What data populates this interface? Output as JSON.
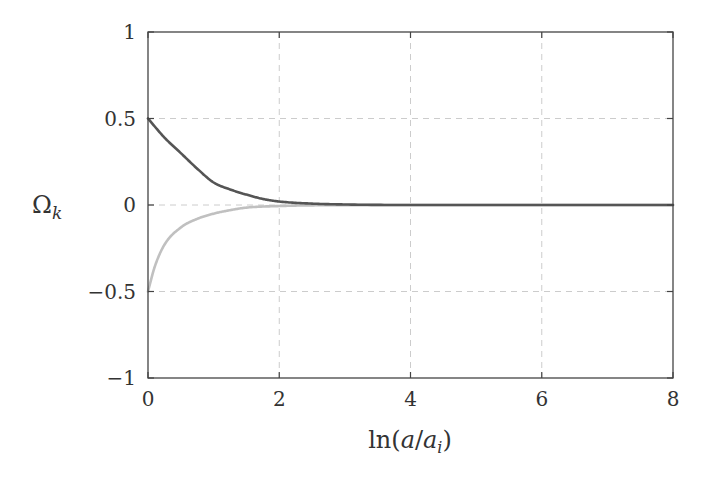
{
  "chart_data": {
    "type": "line",
    "title": "",
    "xlabel": "ln(a/a_i)",
    "ylabel": "Ω_k",
    "xlim": [
      0,
      8
    ],
    "ylim": [
      -1,
      1
    ],
    "xticks": [
      0,
      2,
      4,
      6,
      8
    ],
    "yticks": [
      -1,
      -0.5,
      0,
      0.5,
      1
    ],
    "xtick_labels": [
      "0",
      "2",
      "4",
      "6",
      "8"
    ],
    "ytick_labels": [
      "−1",
      "−0.5",
      "0",
      "0.5",
      "1"
    ],
    "grid": true,
    "legend": null,
    "series": [
      {
        "name": "Ω_k (initial +0.5)",
        "color": "#555555",
        "x": [
          0,
          0.25,
          0.5,
          0.75,
          1.0,
          1.25,
          1.5,
          1.75,
          2.0,
          2.5,
          3,
          4,
          5,
          6,
          7,
          8
        ],
        "y": [
          0.5,
          0.39,
          0.3,
          0.21,
          0.13,
          0.09,
          0.06,
          0.035,
          0.02,
          0.008,
          0.003,
          0.0,
          0.0,
          0.0,
          0.0,
          0.0
        ]
      },
      {
        "name": "Ω_k (initial −0.5)",
        "color": "#c0c0c0",
        "x": [
          0,
          0.1,
          0.25,
          0.5,
          0.75,
          1.0,
          1.25,
          1.5,
          2.0,
          2.5,
          3,
          4,
          5,
          6,
          7,
          8
        ],
        "y": [
          -0.5,
          -0.36,
          -0.23,
          -0.13,
          -0.08,
          -0.05,
          -0.03,
          -0.015,
          -0.006,
          -0.002,
          -0.001,
          0.0,
          0.0,
          0.0,
          0.0,
          0.0
        ]
      }
    ]
  },
  "labels": {
    "xlabel_main": "ln(",
    "xlabel_a": "a",
    "xlabel_slash": "/",
    "xlabel_a2": "a",
    "xlabel_sub": "i",
    "xlabel_close": ")",
    "ylabel_main": "Ω",
    "ylabel_sub": "k"
  },
  "colors": {
    "frame": "#444444",
    "grid": "#cccccc",
    "series_dark": "#555555",
    "series_light": "#c0c0c0"
  }
}
